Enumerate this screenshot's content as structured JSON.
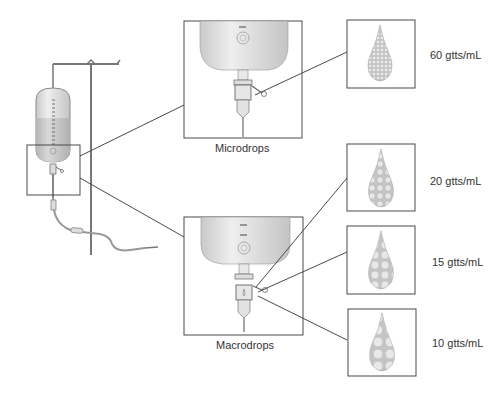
{
  "diagram": {
    "title": "",
    "colors": {
      "line": "#4a4a4a",
      "bag_fill": "#d4d4d4",
      "bag_fluid": "#bdbdbd",
      "drop_fill": "#c8c8c8",
      "drop_bubble": "#e6e6e6",
      "text": "#333333"
    },
    "panels": {
      "micro": {
        "label": "Microdrops"
      },
      "macro": {
        "label": "Macrodrops"
      }
    },
    "drop_sizes": [
      {
        "id": "drop-60",
        "label": "60 gtts/mL",
        "bubble_count": "dense"
      },
      {
        "id": "drop-20",
        "label": "20 gtts/mL",
        "bubble_count": "medium"
      },
      {
        "id": "drop-15",
        "label": "15 gtts/mL",
        "bubble_count": "fewer"
      },
      {
        "id": "drop-10",
        "label": "10 gtts/mL",
        "bubble_count": "fewest"
      }
    ]
  }
}
